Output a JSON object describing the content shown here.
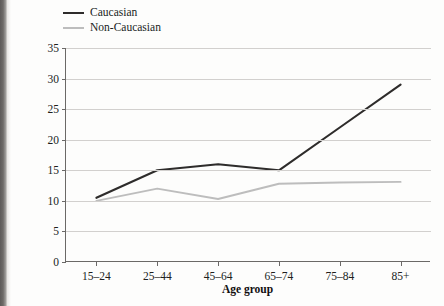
{
  "legend": {
    "items": [
      {
        "label": "Caucasian",
        "color": "#2e2c2b"
      },
      {
        "label": "Non-Caucasian",
        "color": "#bdbdbd"
      }
    ]
  },
  "chart_data": {
    "type": "line",
    "title": "",
    "xlabel": "Age group",
    "ylabel": "Suicide rate per 100,000 population",
    "ylabel_line1": "Suicide rate per 100,000",
    "ylabel_line2": "population",
    "categories": [
      "15–24",
      "25–44",
      "45–64",
      "65–74",
      "75–84",
      "85+"
    ],
    "yticks": [
      0,
      5,
      10,
      15,
      20,
      25,
      30,
      35
    ],
    "ylim": [
      0,
      35
    ],
    "grid": true,
    "legend_position": "top-left",
    "series": [
      {
        "name": "Caucasian",
        "color": "#2e2c2b",
        "values": [
          10.5,
          15.0,
          16.0,
          15.0,
          22.0,
          29.0
        ]
      },
      {
        "name": "Non-Caucasian",
        "color": "#bdbdbd",
        "values": [
          10.0,
          12.0,
          10.3,
          12.8,
          13.0,
          13.1
        ]
      }
    ]
  }
}
